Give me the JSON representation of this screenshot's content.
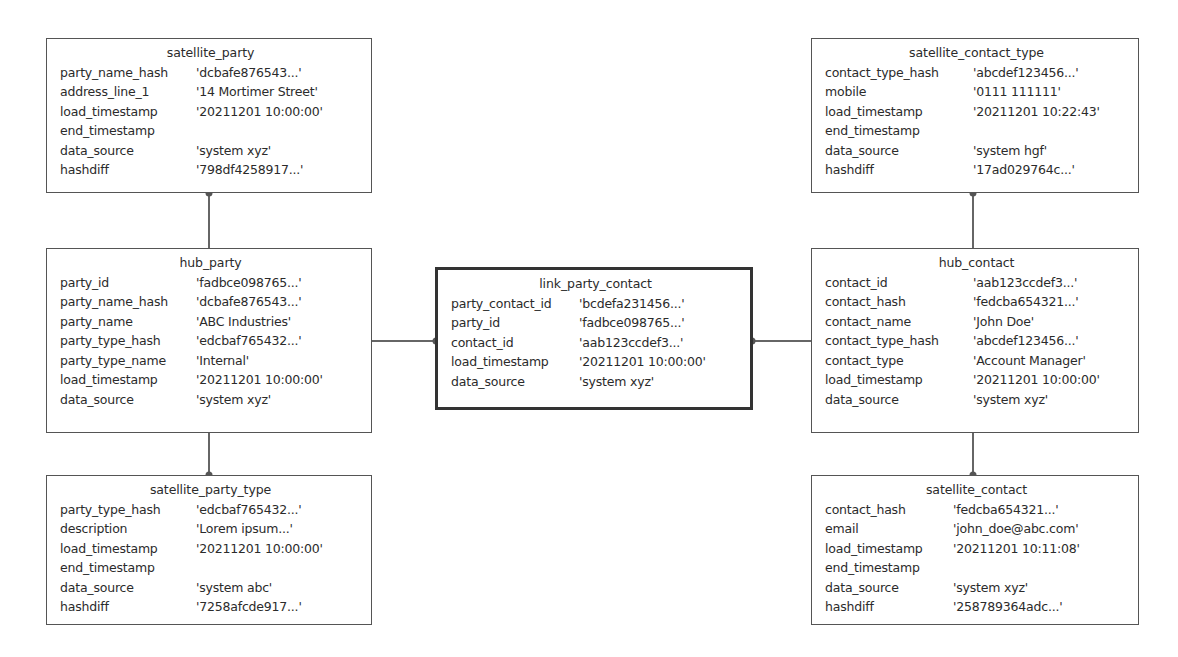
{
  "diagram": {
    "type": "data_vault_model",
    "entities": {
      "satellite_party": {
        "title": "satellite_party",
        "rows": [
          {
            "field": "party_name_hash",
            "value": "'dcbafe876543...'"
          },
          {
            "field": "address_line_1",
            "value": "'14 Mortimer Street'"
          },
          {
            "field": "load_timestamp",
            "value": "'20211201 10:00:00'"
          },
          {
            "field": "end_timestamp",
            "value": ""
          },
          {
            "field": "data_source",
            "value": "'system xyz'"
          },
          {
            "field": "hashdiff",
            "value": "'798df4258917...'"
          }
        ]
      },
      "hub_party": {
        "title": "hub_party",
        "rows": [
          {
            "field": "party_id",
            "value": "'fadbce098765...'"
          },
          {
            "field": "party_name_hash",
            "value": "'dcbafe876543...'"
          },
          {
            "field": "party_name",
            "value": "'ABC Industries'"
          },
          {
            "field": "party_type_hash",
            "value": "'edcbaf765432...'"
          },
          {
            "field": "party_type_name",
            "value": "'Internal'"
          },
          {
            "field": "load_timestamp",
            "value": "'20211201 10:00:00'"
          },
          {
            "field": "data_source",
            "value": "'system xyz'"
          }
        ]
      },
      "satellite_party_type": {
        "title": "satellite_party_type",
        "rows": [
          {
            "field": "party_type_hash",
            "value": "'edcbaf765432...'"
          },
          {
            "field": "description",
            "value": "'Lorem  ipsum...'"
          },
          {
            "field": "load_timestamp",
            "value": "'20211201 10:00:00'"
          },
          {
            "field": "end_timestamp",
            "value": ""
          },
          {
            "field": "data_source",
            "value": "'system abc'"
          },
          {
            "field": "hashdiff",
            "value": "'7258afcde917...'"
          }
        ]
      },
      "link_party_contact": {
        "title": "link_party_contact",
        "rows": [
          {
            "field": "party_contact_id",
            "value": "'bcdefa231456...'"
          },
          {
            "field": "party_id",
            "value": "'fadbce098765...'"
          },
          {
            "field": "contact_id",
            "value": "'aab123ccdef3...'"
          },
          {
            "field": "load_timestamp",
            "value": "'20211201 10:00:00'"
          },
          {
            "field": "data_source",
            "value": "'system xyz'"
          }
        ]
      },
      "satellite_contact_type": {
        "title": "satellite_contact_type",
        "rows": [
          {
            "field": "contact_type_hash",
            "value": "'abcdef123456...'"
          },
          {
            "field": "mobile",
            "value": "'0111 111111'"
          },
          {
            "field": "load_timestamp",
            "value": "'20211201 10:22:43'"
          },
          {
            "field": "end_timestamp",
            "value": ""
          },
          {
            "field": "data_source",
            "value": "'system hgf'"
          },
          {
            "field": "hashdiff",
            "value": "'17ad029764c...'"
          }
        ]
      },
      "hub_contact": {
        "title": "hub_contact",
        "rows": [
          {
            "field": "contact_id",
            "value": "'aab123ccdef3...'"
          },
          {
            "field": "contact_hash",
            "value": "'fedcba654321...'"
          },
          {
            "field": "contact_name",
            "value": "'John Doe'"
          },
          {
            "field": "contact_type_hash",
            "value": "'abcdef123456...'"
          },
          {
            "field": "contact_type",
            "value": "'Account Manager'"
          },
          {
            "field": "load_timestamp",
            "value": "'20211201 10:00:00'"
          },
          {
            "field": "data_source",
            "value": "'system xyz'"
          }
        ]
      },
      "satellite_contact": {
        "title": "satellite_contact",
        "rows": [
          {
            "field": "contact_hash",
            "value": "'fedcba654321...'"
          },
          {
            "field": "email",
            "value": "'john_doe@abc.com'"
          },
          {
            "field": "load_timestamp",
            "value": "'20211201 10:11:08'"
          },
          {
            "field": "end_timestamp",
            "value": ""
          },
          {
            "field": "data_source",
            "value": "'system xyz'"
          },
          {
            "field": "hashdiff",
            "value": "'258789364adc...'"
          }
        ]
      }
    },
    "connections": [
      {
        "from": "satellite_party",
        "to": "hub_party"
      },
      {
        "from": "hub_party",
        "to": "satellite_party_type"
      },
      {
        "from": "hub_party",
        "to": "link_party_contact"
      },
      {
        "from": "link_party_contact",
        "to": "hub_contact"
      },
      {
        "from": "satellite_contact_type",
        "to": "hub_contact"
      },
      {
        "from": "hub_contact",
        "to": "satellite_contact"
      }
    ],
    "colors": {
      "border": "#555555",
      "link_border": "#333333",
      "text": "#2b2b2b",
      "background": "#ffffff"
    }
  }
}
